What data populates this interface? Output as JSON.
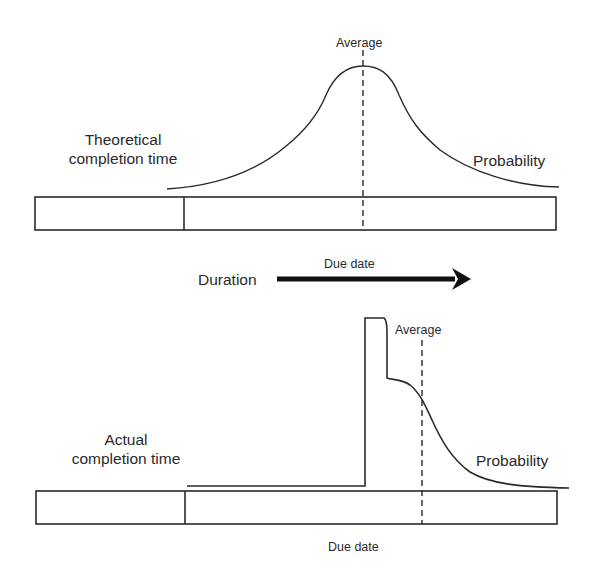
{
  "top_panel": {
    "label_line1": "Theoretical",
    "label_line2": "completion time",
    "average_label": "Average",
    "probability_label": "Probability",
    "curve_shape": "symmetric bell with long right tail"
  },
  "arrow": {
    "left_label": "Duration",
    "above_label": "Due date",
    "direction": "right"
  },
  "bottom_panel": {
    "label_line1": "Actual",
    "label_line2": "completion time",
    "average_label": "Average",
    "probability_label": "Probability",
    "due_date_label": "Due date",
    "curve_shape": "near-zero until due date, sharp spike, then skewed decay"
  },
  "colors": {
    "line": "#2a2a2a",
    "background": "#ffffff"
  }
}
